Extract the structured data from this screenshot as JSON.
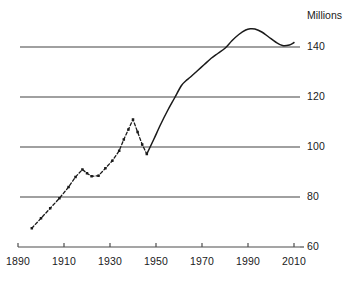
{
  "chart_data": {
    "type": "line",
    "title": "",
    "subtitle": "",
    "unit_label": "Millions",
    "xlabel": "",
    "ylabel": "",
    "xlim": [
      1890,
      2014
    ],
    "ylim": [
      60,
      152
    ],
    "yticks": [
      60,
      80,
      100,
      120,
      140
    ],
    "ytick_labels": [
      "60",
      "80",
      "100",
      "120",
      "140"
    ],
    "xticks": [
      1890,
      1910,
      1930,
      1950,
      1970,
      1990,
      2010
    ],
    "xtick_labels": [
      "1890",
      "1910",
      "1930",
      "1950",
      "1970",
      "1990",
      "2010"
    ],
    "grid": "horizontal",
    "gridline_values": [
      80,
      100,
      120,
      140
    ],
    "legend": "none",
    "axis_position": "right",
    "line_color": "#1a1a1a",
    "grid_color": "#808080",
    "axis_color": "#4d4d4d",
    "series": [
      {
        "name": "historical-estimates",
        "style": "dashed",
        "markers": true,
        "x": [
          1896,
          1900,
          1904,
          1908,
          1912,
          1915,
          1918,
          1920,
          1922,
          1925,
          1928,
          1931,
          1934,
          1936,
          1938,
          1940,
          1942,
          1944,
          1946
        ],
        "values": [
          67.5,
          71.5,
          75.5,
          79.5,
          84.0,
          88.0,
          91.0,
          89.5,
          88.3,
          88.5,
          91.5,
          94.5,
          98.5,
          103.0,
          107.0,
          111.0,
          106.0,
          101.0,
          97.2
        ]
      },
      {
        "name": "recorded",
        "style": "solid",
        "markers": false,
        "x": [
          1946,
          1949,
          1952,
          1955,
          1958,
          1961,
          1963,
          1965,
          1968,
          1971,
          1974,
          1977,
          1980,
          1983,
          1986,
          1989,
          1991,
          1993,
          1996,
          1999,
          2002,
          2005,
          2008,
          2010
        ],
        "values": [
          97.2,
          103.0,
          109.0,
          114.5,
          119.5,
          124.5,
          126.5,
          128.0,
          130.5,
          133.0,
          135.5,
          137.5,
          139.5,
          142.5,
          145.0,
          146.8,
          147.3,
          147.2,
          146.0,
          144.0,
          142.0,
          140.6,
          140.8,
          141.8
        ]
      }
    ]
  },
  "geometry": {
    "plot_left": 18,
    "plot_right": 300,
    "grid_left": 20,
    "y_top_value": 152,
    "y_bottom_value": 60,
    "y_top_px": 17,
    "y_bottom_px": 247,
    "x_min_px": 18,
    "x_max_px": 294,
    "x_min_year": 1890,
    "x_max_year": 2010
  }
}
